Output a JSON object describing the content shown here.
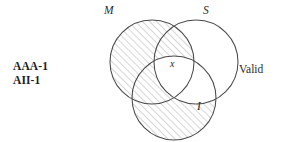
{
  "diagram": {
    "type": "venn-three-circle",
    "title_text": "",
    "circles": [
      {
        "id": "M",
        "label": "M",
        "cx": 152,
        "cy": 62,
        "r": 42,
        "label_x": 104,
        "label_y": 4
      },
      {
        "id": "S",
        "label": "S",
        "cx": 196,
        "cy": 62,
        "r": 42,
        "label_x": 203,
        "label_y": 4
      },
      {
        "id": "I",
        "label": "I",
        "cx": 174,
        "cy": 98,
        "r": 42,
        "label_x": 197,
        "label_y": 100
      }
    ],
    "shaded_regions": [
      "M-only",
      "M-and-S-not-I",
      "I-only",
      "I-and-M-not-S"
    ],
    "unshaded_regions": [
      "S-only",
      "S-and-I-not-M",
      "M-and-S-and-I"
    ],
    "marks": [
      {
        "id": "x",
        "text": "x",
        "region": "M-and-S-and-I",
        "x": 173,
        "y": 64
      }
    ],
    "stroke_color": "#4a4a4a",
    "hatch_color": "#9a9a9a",
    "background_color": "#ffffff"
  },
  "annotations": {
    "syllogism_forms": [
      "AAA-1",
      "AII-1"
    ],
    "validity": "Valid"
  }
}
